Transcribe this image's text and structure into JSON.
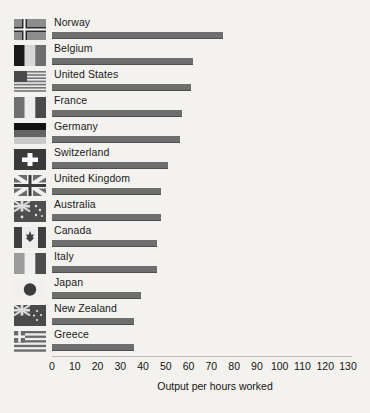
{
  "chart_data": {
    "type": "bar",
    "orientation": "horizontal",
    "title": "",
    "xlabel": "Output per hours worked",
    "ylabel": "",
    "xlim": [
      0,
      130
    ],
    "xticks": [
      0,
      10,
      20,
      30,
      40,
      50,
      60,
      70,
      80,
      90,
      100,
      110,
      120,
      130
    ],
    "grid": false,
    "legend": false,
    "bar_color": "#6e6e6e",
    "background_color": "#f3f2ef",
    "categories": [
      "Norway",
      "Belgium",
      "United States",
      "France",
      "Germany",
      "Switzerland",
      "United Kingdom",
      "Australia",
      "Canada",
      "Italy",
      "Japan",
      "New Zealand",
      "Greece"
    ],
    "values": [
      75,
      62,
      61,
      57,
      56,
      51,
      48,
      48,
      46,
      46,
      39,
      36,
      36
    ],
    "series": [
      {
        "name": "Output per hours worked",
        "values": [
          75,
          62,
          61,
          57,
          56,
          51,
          48,
          48,
          46,
          46,
          39,
          36,
          36
        ]
      }
    ],
    "rows": [
      {
        "label": "Norway",
        "value": 75,
        "flag": "flag-norway"
      },
      {
        "label": "Belgium",
        "value": 62,
        "flag": "flag-belgium"
      },
      {
        "label": "United States",
        "value": 61,
        "flag": "flag-united-states"
      },
      {
        "label": "France",
        "value": 57,
        "flag": "flag-france"
      },
      {
        "label": "Germany",
        "value": 56,
        "flag": "flag-germany"
      },
      {
        "label": "Switzerland",
        "value": 51,
        "flag": "flag-switzerland"
      },
      {
        "label": "United Kingdom",
        "value": 48,
        "flag": "flag-united-kingdom"
      },
      {
        "label": "Australia",
        "value": 48,
        "flag": "flag-australia"
      },
      {
        "label": "Canada",
        "value": 46,
        "flag": "flag-canada"
      },
      {
        "label": "Italy",
        "value": 46,
        "flag": "flag-italy"
      },
      {
        "label": "Japan",
        "value": 39,
        "flag": "flag-japan"
      },
      {
        "label": "New Zealand",
        "value": 36,
        "flag": "flag-new-zealand"
      },
      {
        "label": "Greece",
        "value": 36,
        "flag": "flag-greece"
      }
    ]
  }
}
